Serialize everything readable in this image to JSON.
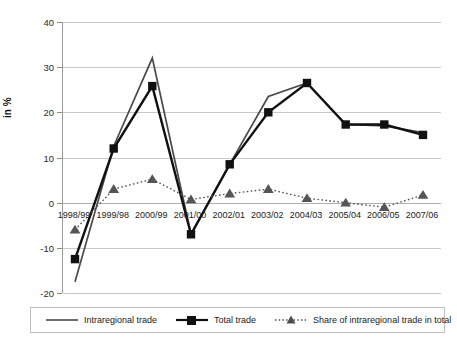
{
  "chart_data": {
    "type": "line",
    "title": "",
    "xlabel": "",
    "ylabel": "in %",
    "ylim": [
      -20,
      40
    ],
    "yticks": [
      -20,
      -10,
      0,
      10,
      20,
      30,
      40
    ],
    "grid": true,
    "legend_position": "bottom",
    "categories": [
      "1998/99",
      "1999/98",
      "2000/99",
      "2001/00",
      "2002/01",
      "2003/02",
      "2004/03",
      "2005/04",
      "2006/05",
      "2007/06"
    ],
    "series": [
      {
        "name": "Intraregional trade",
        "marker": "none",
        "linestyle": "solid",
        "color": "#4a4a4a",
        "values": [
          -17.5,
          12.5,
          32.0,
          -7.0,
          8.5,
          23.5,
          26.5,
          17.3,
          17.0,
          15.5
        ]
      },
      {
        "name": "Total trade",
        "marker": "square",
        "linestyle": "solid",
        "color": "#111111",
        "values": [
          -12.5,
          12.0,
          25.8,
          -7.0,
          8.5,
          20.0,
          26.5,
          17.3,
          17.3,
          15.0
        ]
      },
      {
        "name": "Share of intraregional trade in total",
        "marker": "triangle",
        "linestyle": "dotted",
        "color": "#555555",
        "values": [
          -6.0,
          3.0,
          5.2,
          0.7,
          2.0,
          3.0,
          1.0,
          0.0,
          -1.0,
          1.7
        ]
      }
    ]
  },
  "legend": {
    "items": [
      {
        "label": "Intraregional trade"
      },
      {
        "label": "Total trade"
      },
      {
        "label": "Share of intraregional trade in total"
      }
    ]
  },
  "axes": {
    "y_title": "in %"
  }
}
